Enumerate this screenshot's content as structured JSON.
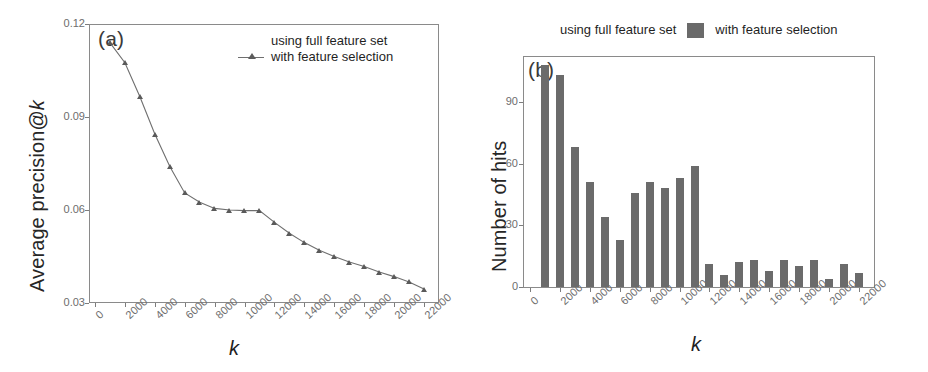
{
  "figure": {
    "panels": [
      {
        "tag": "(a)",
        "xlabel": "k",
        "ylabel_prefix": "Average precision@",
        "ylabel_italic": "k"
      },
      {
        "tag": "(b)",
        "xlabel": "k",
        "ylabel": "Number of hits"
      }
    ]
  },
  "legend_a": {
    "entries": [
      {
        "label": "using full feature set",
        "marker": "none"
      },
      {
        "label": "with feature selection",
        "marker": "line-triangle"
      }
    ]
  },
  "legend_b": {
    "entries": [
      {
        "label": "using full feature set",
        "marker": "none"
      },
      {
        "label": "with feature selection",
        "marker": "filled-square"
      }
    ],
    "swatch_color": "#6a6a6a"
  },
  "colors": {
    "line": "#6f6f6f",
    "marker": "#5a5a5a",
    "bar": "#6b6b6b",
    "axis": "#7d7d7d",
    "frame": "#8a8a8a",
    "tick_text": "#6d6d6d",
    "label_text": "#1f1f1f"
  },
  "chart_data": [
    {
      "type": "line",
      "panel": "(a)",
      "title": "",
      "xlabel": "k",
      "ylabel": "Average precision@k",
      "xlim": [
        -400,
        23000
      ],
      "ylim": [
        0.03,
        0.12
      ],
      "xticks": [
        0,
        2000,
        4000,
        6000,
        8000,
        10000,
        12000,
        14000,
        16000,
        18000,
        20000,
        22000
      ],
      "xticklabels": [
        "0",
        "2000",
        "4000",
        "6000",
        "8000",
        "10000",
        "12000",
        "14000",
        "16000",
        "18000",
        "20000",
        "22000"
      ],
      "yticks": [
        0.03,
        0.06,
        0.09,
        0.12
      ],
      "yticklabels": [
        "0.03",
        "0.06",
        "0.09",
        "0.12"
      ],
      "grid": false,
      "legend_position": "upper right",
      "series": [
        {
          "name": "with feature selection",
          "marker": "triangle",
          "x": [
            1000,
            2000,
            3000,
            4000,
            5000,
            6000,
            7000,
            8000,
            9000,
            10000,
            11000,
            12000,
            13000,
            14000,
            15000,
            16000,
            17000,
            18000,
            19000,
            20000,
            21000,
            22000
          ],
          "values": [
            0.114,
            0.1075,
            0.0965,
            0.0845,
            0.074,
            0.0655,
            0.0625,
            0.0605,
            0.06,
            0.0598,
            0.0598,
            0.056,
            0.0525,
            0.0495,
            0.047,
            0.045,
            0.0432,
            0.0418,
            0.04,
            0.0385,
            0.0368,
            0.0345
          ]
        }
      ]
    },
    {
      "type": "bar",
      "panel": "(b)",
      "title": "",
      "xlabel": "k",
      "ylabel": "Number of hits",
      "xlim": [
        -400,
        23000
      ],
      "ylim": [
        0,
        112
      ],
      "xticks": [
        0,
        2000,
        4000,
        6000,
        8000,
        10000,
        12000,
        14000,
        16000,
        18000,
        20000,
        22000
      ],
      "xticklabels": [
        "0",
        "2000",
        "4000",
        "6000",
        "8000",
        "10000",
        "12000",
        "14000",
        "16000",
        "18000",
        "20000",
        "22000"
      ],
      "yticks": [
        0,
        30,
        60,
        90
      ],
      "yticklabels": [
        "0",
        "30",
        "60",
        "90"
      ],
      "grid": false,
      "legend_position": "above",
      "categories": [
        1000,
        2000,
        3000,
        4000,
        5000,
        6000,
        7000,
        8000,
        9000,
        10000,
        11000,
        12000,
        13000,
        14000,
        15000,
        16000,
        17000,
        18000,
        19000,
        20000,
        21000,
        22000
      ],
      "series": [
        {
          "name": "with feature selection",
          "values": [
            108,
            103,
            68,
            51,
            34,
            23,
            46,
            51,
            48,
            53,
            59,
            11,
            6,
            12,
            13,
            8,
            13,
            10,
            13,
            4,
            11,
            7,
            2
          ]
        }
      ]
    }
  ]
}
